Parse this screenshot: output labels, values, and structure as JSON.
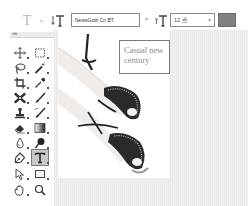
{
  "options_bar": {
    "tool_preset_icon": "type-tool-icon",
    "tool_preset_glyph": "T",
    "tool_preset_arrow": "▾",
    "orientation_icon": "text-orientation-icon",
    "font_family": "NewsGoth Cn BT",
    "font_family_arrow": "▾",
    "font_size_icon": "font-size-icon",
    "font_size": "12 点",
    "font_size_arrow": "▾",
    "text_color": "#808080"
  },
  "toolbox": {
    "collapse_glyph": "««",
    "tools": [
      {
        "name": "move-tool",
        "icon": "move-icon"
      },
      {
        "name": "marquee-tool",
        "icon": "rect-marquee-icon"
      },
      {
        "name": "lasso-tool",
        "icon": "lasso-icon"
      },
      {
        "name": "quick-select-tool",
        "icon": "magic-wand-icon"
      },
      {
        "name": "crop-tool",
        "icon": "crop-icon"
      },
      {
        "name": "eyedropper-tool",
        "icon": "eyedropper-icon"
      },
      {
        "name": "healing-tool",
        "icon": "bandage-icon"
      },
      {
        "name": "brush-tool",
        "icon": "brush-icon"
      },
      {
        "name": "stamp-tool",
        "icon": "stamp-icon"
      },
      {
        "name": "history-brush-tool",
        "icon": "history-brush-icon"
      },
      {
        "name": "eraser-tool",
        "icon": "eraser-icon"
      },
      {
        "name": "gradient-tool",
        "icon": "gradient-icon"
      },
      {
        "name": "blur-tool",
        "icon": "blur-icon"
      },
      {
        "name": "dodge-tool",
        "icon": "dodge-icon"
      },
      {
        "name": "pen-tool",
        "icon": "pen-icon"
      },
      {
        "name": "type-tool",
        "icon": "type-icon",
        "active": true
      },
      {
        "name": "path-select-tool",
        "icon": "arrow-select-icon"
      },
      {
        "name": "shape-tool",
        "icon": "rectangle-shape-icon"
      },
      {
        "name": "hand-tool",
        "icon": "hand-icon"
      },
      {
        "name": "zoom-tool",
        "icon": "zoom-icon"
      }
    ]
  },
  "canvas": {
    "image_subject": "woman's feet in strappy studded sandals",
    "text_layer": "Casual new\ncentury"
  }
}
